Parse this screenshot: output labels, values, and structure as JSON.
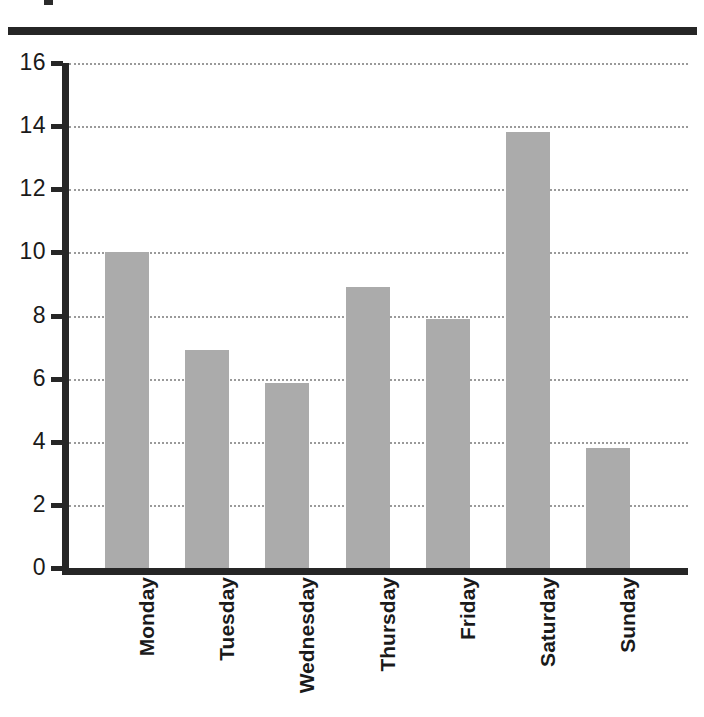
{
  "page": {
    "background_color": "#ffffff",
    "rule_color": "#262626"
  },
  "chart_data": {
    "type": "bar",
    "title": "",
    "subtitle": "",
    "xlabel": "",
    "ylabel": "",
    "categories": [
      "Monday",
      "Tuesday",
      "Wednesday",
      "Thursday",
      "Friday",
      "Saturday",
      "Sunday"
    ],
    "values": [
      10.0,
      6.9,
      5.85,
      8.9,
      7.9,
      13.8,
      3.8
    ],
    "ylim": [
      0,
      16
    ],
    "yticks": [
      0,
      2,
      4,
      6,
      8,
      10,
      12,
      14,
      16
    ],
    "ytick_labels": [
      "0",
      "2",
      "4",
      "6",
      "8",
      "10",
      "12",
      "14",
      "16"
    ],
    "grid": true,
    "grid_style": "dotted",
    "grid_axis": "y",
    "legend": false,
    "legend_position": "none",
    "bar_color": "#ababab",
    "axis_color": "#262626",
    "grid_color": "#9a9a9a",
    "xtick_label_rotation": 90,
    "bars": [
      {
        "category": "Monday",
        "value": 10.0
      },
      {
        "category": "Tuesday",
        "value": 6.9
      },
      {
        "category": "Wednesday",
        "value": 5.85
      },
      {
        "category": "Thursday",
        "value": 8.9
      },
      {
        "category": "Friday",
        "value": 7.9
      },
      {
        "category": "Saturday",
        "value": 13.8
      },
      {
        "category": "Sunday",
        "value": 3.8
      }
    ]
  }
}
